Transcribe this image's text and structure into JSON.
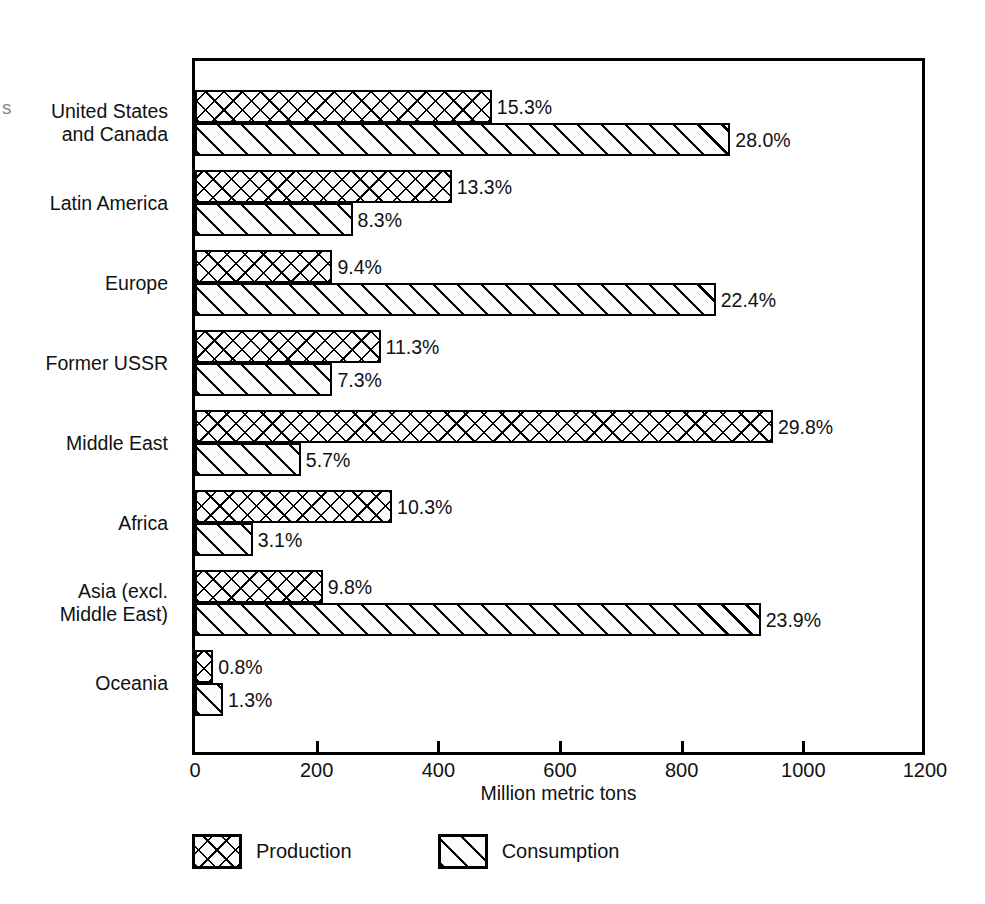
{
  "chart_data": {
    "type": "bar",
    "orientation": "horizontal",
    "title": "",
    "xlabel": "Million metric tons",
    "ylabel": "",
    "xlim": [
      0,
      1200
    ],
    "xticks": [
      0,
      200,
      400,
      600,
      800,
      1000,
      1200
    ],
    "grid": false,
    "legend_position": "bottom-left",
    "categories": [
      "United States\nand Canada",
      "Latin America",
      "Europe",
      "Former USSR",
      "Middle East",
      "Africa",
      "Asia (excl.\nMiddle East)",
      "Oceania"
    ],
    "series": [
      {
        "name": "Production",
        "values": [
          488,
          422,
          226,
          305,
          950,
          324,
          210,
          30
        ],
        "labels": [
          "15.3%",
          "13.3%",
          "9.4%",
          "11.3%",
          "29.8%",
          "10.3%",
          "9.8%",
          "0.8%"
        ],
        "pattern": "cross-hatch"
      },
      {
        "name": "Consumption",
        "values": [
          880,
          259,
          856,
          226,
          174,
          95,
          930,
          46
        ],
        "labels": [
          "28.0%",
          "8.3%",
          "22.4%",
          "7.3%",
          "5.7%",
          "3.1%",
          "23.9%",
          "1.3%"
        ],
        "pattern": "diagonal-hatch"
      }
    ]
  },
  "legend": {
    "items": [
      {
        "label": "Production",
        "pattern": "cross-hatch"
      },
      {
        "label": "Consumption",
        "pattern": "diagonal-hatch"
      }
    ]
  },
  "axis": {
    "x_title": "Million metric tons",
    "tick_labels": [
      "0",
      "200",
      "400",
      "600",
      "800",
      "1000",
      "1200"
    ]
  },
  "artifact": {
    "edge_text": "s"
  },
  "colors": {
    "foreground": "#000000",
    "background": "#ffffff",
    "bar_fill": "#fbfbfb"
  }
}
